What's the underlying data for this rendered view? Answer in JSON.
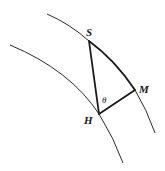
{
  "diagram": {
    "type": "geometry",
    "points": {
      "S": {
        "label": "S",
        "x": 89,
        "y": 41
      },
      "M": {
        "label": "M",
        "x": 135,
        "y": 90
      },
      "H": {
        "label": "H",
        "x": 99,
        "y": 114
      }
    },
    "angle": {
      "label": "θ",
      "vertex": "H"
    },
    "edges": [
      {
        "from": "S",
        "to": "H"
      },
      {
        "from": "H",
        "to": "M"
      },
      {
        "from": "S",
        "to": "M",
        "curved": true
      }
    ],
    "arcs": [
      {
        "name": "outer-arc"
      },
      {
        "name": "inner-arc"
      }
    ],
    "colors": {
      "stroke": "#1a1a1a",
      "background": "#ffffff"
    }
  }
}
